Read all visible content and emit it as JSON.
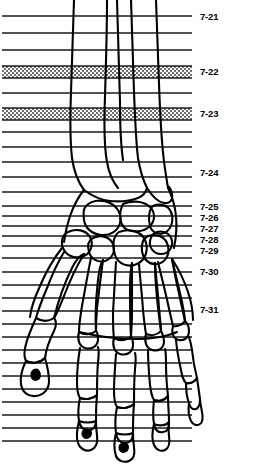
{
  "figure": {
    "view": "palmar-dorsal-radiographic-outline",
    "ink_color": "#000000",
    "background_color": "#ffffff",
    "band_fill_color": "#c8c8c8",
    "line_color": "#1a1a1a",
    "canvas": {
      "width": 255,
      "height": 464
    }
  },
  "section_lines": {
    "description": "Horizontal section level lines crossing the limb from left margin to x=192",
    "x_start": 2,
    "x_end": 192,
    "y_values": [
      16,
      33,
      50,
      66,
      78,
      93,
      108,
      120,
      132,
      147,
      162,
      177,
      192,
      206,
      216,
      226,
      236,
      246,
      258,
      272,
      285,
      298,
      311,
      324,
      337,
      350,
      363,
      376,
      389,
      402,
      415,
      428,
      441
    ]
  },
  "shaded_bands": [
    {
      "name": "band-7-22",
      "y": 66,
      "height": 12,
      "label": "7-22"
    },
    {
      "name": "band-7-23",
      "y": 108,
      "height": 12,
      "label": "7-23"
    }
  ],
  "labels": [
    {
      "id": "7-21",
      "text": "7-21",
      "x": 200,
      "y": 12,
      "line_y": 16
    },
    {
      "id": "7-22",
      "text": "7-22",
      "x": 200,
      "y": 67,
      "line_y": 72
    },
    {
      "id": "7-23",
      "text": "7-23",
      "x": 200,
      "y": 109,
      "line_y": 114
    },
    {
      "id": "7-24",
      "text": "7-24",
      "x": 200,
      "y": 168,
      "line_y": 172
    },
    {
      "id": "7-25",
      "text": "7-25",
      "x": 200,
      "y": 203,
      "line_y": 206
    },
    {
      "id": "7-26",
      "text": "7-26",
      "x": 200,
      "y": 214,
      "line_y": 216
    },
    {
      "id": "7-27",
      "text": "7-27",
      "x": 200,
      "y": 225,
      "line_y": 226
    },
    {
      "id": "7-28",
      "text": "7-28",
      "x": 200,
      "y": 236,
      "line_y": 236
    },
    {
      "id": "7-29",
      "text": "7-29",
      "x": 200,
      "y": 247,
      "line_y": 246
    },
    {
      "id": "7-30",
      "text": "7-30",
      "x": 200,
      "y": 267,
      "line_y": 272
    },
    {
      "id": "7-31",
      "text": "7-31",
      "x": 200,
      "y": 304,
      "line_y": 311
    }
  ],
  "anatomy": {
    "regions": [
      {
        "name": "distal-forearm",
        "bones": [
          "radius",
          "ulna"
        ]
      },
      {
        "name": "carpus",
        "bones": [
          "scaphoid",
          "lunate",
          "triquetrum",
          "pisiform",
          "trapezium",
          "trapezoid",
          "capitate",
          "hamate"
        ]
      },
      {
        "name": "metacarpus",
        "bones": [
          "metacarpal-1",
          "metacarpal-2",
          "metacarpal-3",
          "metacarpal-4",
          "metacarpal-5"
        ]
      },
      {
        "name": "digits",
        "bones": [
          "proximal-phalanges",
          "middle-phalanges",
          "distal-phalanges"
        ]
      }
    ]
  }
}
